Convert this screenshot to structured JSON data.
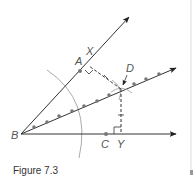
{
  "caption": "Figure 7.3",
  "labels": {
    "A": "A",
    "B": "B",
    "C": "C",
    "D": "D",
    "X": "X",
    "Y": "Y"
  },
  "colors": {
    "line": "#333333",
    "arc": "#aaaaaa",
    "dot": "#777777",
    "label": "#555555",
    "edge": "#cccccc"
  }
}
